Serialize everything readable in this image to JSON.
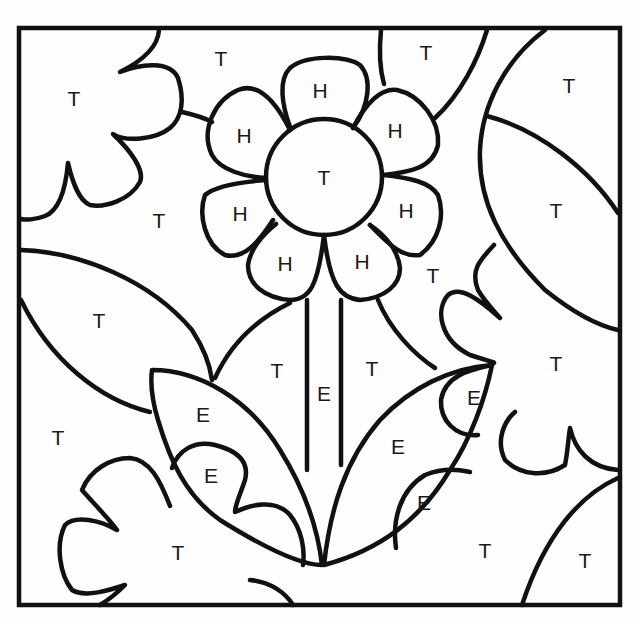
{
  "worksheet": {
    "type": "color-by-letter",
    "regions": {
      "background_tl_leaf": "T",
      "top_center": "T",
      "top_right_leaf": "T",
      "right_upper_leaf": "T",
      "right_lower_leaf": "T",
      "left_middle_gap": "T",
      "left_leaf": "T",
      "left_bottom": "T",
      "right_of_flower": "T",
      "stem_left_region": "T",
      "stem_right_region": "T",
      "bottom_left_leaf": "T",
      "bottom_center": "T",
      "bottom_right": "T",
      "flower_center": "T",
      "petal_top": "H",
      "petal_top_left": "H",
      "petal_top_right": "H",
      "petal_left": "H",
      "petal_right": "H",
      "petal_bottom_left": "H",
      "petal_bottom_right": "H",
      "stem": "E",
      "left_leaf_upper": "E",
      "left_leaf_lower": "E",
      "right_leaf_main": "E",
      "right_leaf_small": "E",
      "right_leaf_tip": "E"
    }
  },
  "colors": {
    "line": "#111111",
    "paper": "#fefefe"
  }
}
